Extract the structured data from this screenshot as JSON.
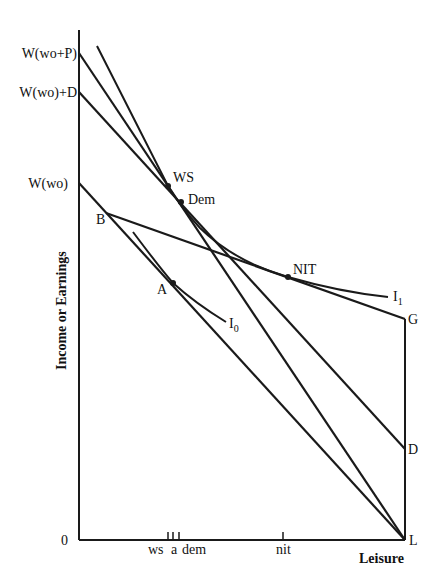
{
  "diagram": {
    "y_axis_label": "Income or Earnings",
    "x_axis_label": "Leisure",
    "origin_label": "0",
    "y_intercepts": [
      {
        "label": "W(wo+P)",
        "y": 53
      },
      {
        "label": "W(wo)+D",
        "y": 92
      },
      {
        "label": "W(wo)",
        "y": 183
      }
    ],
    "points": {
      "WS": "WS",
      "Dem": "Dem",
      "B": "B",
      "A": "A",
      "NIT": "NIT",
      "G": "G",
      "D": "D",
      "L": "L"
    },
    "curves": {
      "I0": {
        "base": "I",
        "sub": "0"
      },
      "I1": {
        "base": "I",
        "sub": "1"
      }
    },
    "x_ticks": {
      "ws": "ws",
      "a": "a",
      "dem": "dem",
      "nit": "nit"
    },
    "colors": {
      "line": "#1a1a1a",
      "background": "#ffffff"
    }
  }
}
